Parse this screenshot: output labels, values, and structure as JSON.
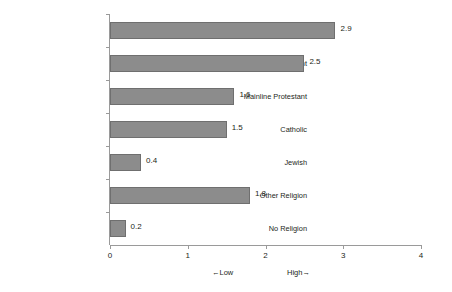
{
  "chart_data": {
    "type": "bar",
    "orientation": "horizontal",
    "title": "",
    "xlabel": "",
    "ylabel": "",
    "categories": [
      "Evangelical Protestant",
      "Black Protestant",
      "Mainline Protestant",
      "Catholic",
      "Jewish",
      "Other Religion",
      "No Religion"
    ],
    "values": [
      2.9,
      2.5,
      1.6,
      1.5,
      0.4,
      1.8,
      0.2
    ],
    "value_labels": [
      "2.9",
      "2.5",
      "1.6",
      "1.5",
      "0.4",
      "1.8",
      "0.2"
    ],
    "xlim": [
      0,
      4
    ],
    "xticks": [
      0,
      1,
      2,
      3,
      4
    ],
    "xtick_labels": [
      "0",
      "1",
      "2",
      "3",
      "4"
    ],
    "grid": false,
    "legend": null,
    "annotations": {
      "low": "←Low",
      "high": "High→"
    },
    "colors": {
      "bar_fill": "#8c8c8c",
      "bar_border": "#6f6f6f",
      "axis": "#9a9a9a",
      "text": "#231f20",
      "background": "#ffffff"
    }
  }
}
